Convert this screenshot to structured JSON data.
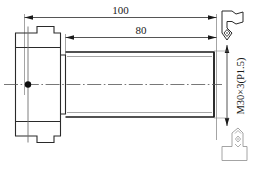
{
  "drawing": {
    "title": "threaded-stud-with-flange-head",
    "dimensions": {
      "overall_length": {
        "label": "100",
        "unit_implied": "mm"
      },
      "thread_length": {
        "label": "80",
        "unit_implied": "mm"
      }
    },
    "thread_spec": {
      "label": "M30×3(P1.5)"
    },
    "surface_symbols": [
      {
        "name": "surface-roughness-symbol-top",
        "position": "top-right",
        "inner_mark": "◇"
      },
      {
        "name": "surface-roughness-symbol-bottom",
        "position": "bottom-right",
        "marks": [
          "∧",
          "◇",
          "∨"
        ]
      }
    ],
    "features": {
      "center_hole": "center-bore-mark",
      "centerline": "dash-dot-axis",
      "flange": "stepped-flange-head",
      "shaft": "threaded-cylindrical-shaft"
    },
    "colors": {
      "line": "#1a1a1a",
      "thin_line": "#8a8a8a",
      "background": "#ffffff",
      "symbol": "#6a6a6a"
    },
    "footer_caption": ""
  }
}
